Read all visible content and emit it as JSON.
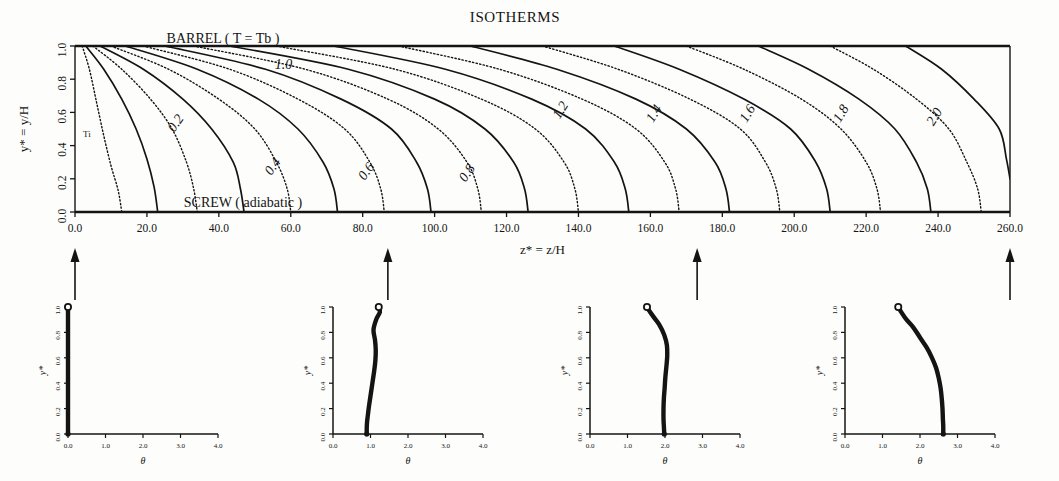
{
  "figure": {
    "title": "ISOTHERMS",
    "barrel_label": "BARREL ( T = Tb )",
    "screw_label": "SCREW ( adiabatic )",
    "inlet_label": "Ti"
  },
  "main": {
    "xlabel": "z* = z/H",
    "ylabel": "y* = y/H",
    "xticks": [
      "0.0",
      "20.0",
      "40.0",
      "60.0",
      "80.0",
      "100.0",
      "120.0",
      "140.0",
      "160.0",
      "180.0",
      "200.0",
      "220.0",
      "240.0",
      "260.0"
    ],
    "yticks": [
      "0.0",
      "0.2",
      "0.4",
      "0.6",
      "0.8",
      "1.0"
    ],
    "contour_labels": [
      "0.2",
      "0.4",
      "0.6",
      "0.8",
      "1.0",
      "1.2",
      "1.4",
      "1.6",
      "1.8",
      "2.0"
    ]
  },
  "subplots": [
    {
      "name": "profile-z0",
      "xlabel": "θ",
      "ylabel": "y*",
      "xticks": [
        "0.0",
        "1.0",
        "2.0",
        "3.0",
        "4.0"
      ],
      "yticks": [
        "0.0",
        "0.2",
        "0.4",
        "0.6",
        "0.8",
        "1.0"
      ]
    },
    {
      "name": "profile-z87",
      "xlabel": "θ",
      "ylabel": "y*",
      "xticks": [
        "0.0",
        "1.0",
        "2.0",
        "3.0",
        "4.0"
      ],
      "yticks": [
        "0.0",
        "0.2",
        "0.4",
        "0.6",
        "0.8",
        "1.0"
      ]
    },
    {
      "name": "profile-z173",
      "xlabel": "θ",
      "ylabel": "y*",
      "xticks": [
        "0.0",
        "1.0",
        "2.0",
        "3.0",
        "4.0"
      ],
      "yticks": [
        "0.0",
        "0.2",
        "0.4",
        "0.6",
        "0.8",
        "1.0"
      ]
    },
    {
      "name": "profile-z260",
      "xlabel": "θ",
      "ylabel": "y*",
      "xticks": [
        "0.0",
        "1.0",
        "2.0",
        "3.0",
        "4.0"
      ],
      "yticks": [
        "0.0",
        "0.2",
        "0.4",
        "0.6",
        "0.8",
        "1.0"
      ]
    }
  ],
  "chart_data": [
    {
      "type": "contour",
      "title": "ISOTHERMS",
      "xlabel": "z* = z/H",
      "ylabel": "y* = y/H",
      "xlim": [
        0,
        260
      ],
      "ylim": [
        0,
        1
      ],
      "grid": false,
      "annotations": [
        "BARREL ( T = Tb )",
        "SCREW ( adiabatic )",
        "Ti"
      ],
      "levels": [
        0.2,
        0.4,
        0.6,
        0.8,
        1.0,
        1.2,
        1.4,
        1.6,
        1.8,
        2.0
      ],
      "level_styles": [
        "solid",
        "solid",
        "solid",
        "solid",
        "solid",
        "solid",
        "solid",
        "solid",
        "solid",
        "solid"
      ],
      "intermediate_levels": [
        0.1,
        0.3,
        0.5,
        0.7,
        0.9,
        1.1,
        1.3,
        1.5,
        1.7,
        1.9,
        2.1
      ],
      "intermediate_style": "dotted",
      "contours": [
        {
          "level": 0.1,
          "style": "dotted",
          "label": "",
          "points": [
            [
              2,
              1.0
            ],
            [
              4,
              0.86
            ],
            [
              6,
              0.66
            ],
            [
              8,
              0.46
            ],
            [
              10,
              0.28
            ],
            [
              12,
              0.13
            ],
            [
              13,
              0.0
            ]
          ]
        },
        {
          "level": 0.2,
          "style": "solid",
          "label": "0.2",
          "label_xy": [
            29,
            0.52
          ],
          "points": [
            [
              3,
              1.0
            ],
            [
              8,
              0.86
            ],
            [
              13,
              0.68
            ],
            [
              17,
              0.5
            ],
            [
              20,
              0.32
            ],
            [
              22,
              0.15
            ],
            [
              23,
              0.0
            ]
          ]
        },
        {
          "level": 0.3,
          "style": "dotted",
          "label": "",
          "points": [
            [
              5,
              1.0
            ],
            [
              13,
              0.86
            ],
            [
              21,
              0.68
            ],
            [
              27,
              0.5
            ],
            [
              31,
              0.3
            ],
            [
              33,
              0.14
            ],
            [
              34,
              0.0
            ]
          ]
        },
        {
          "level": 0.4,
          "style": "solid",
          "label": "0.4",
          "label_xy": [
            56,
            0.26
          ],
          "points": [
            [
              7,
              1.0
            ],
            [
              19,
              0.86
            ],
            [
              30,
              0.68
            ],
            [
              38,
              0.5
            ],
            [
              44,
              0.3
            ],
            [
              46,
              0.14
            ],
            [
              47,
              0.0
            ]
          ]
        },
        {
          "level": 0.5,
          "style": "dotted",
          "label": "",
          "points": [
            [
              10,
              1.0
            ],
            [
              26,
              0.86
            ],
            [
              40,
              0.68
            ],
            [
              50,
              0.5
            ],
            [
              56,
              0.3
            ],
            [
              59,
              0.14
            ],
            [
              60,
              0.0
            ]
          ]
        },
        {
          "level": 0.6,
          "style": "solid",
          "label": "0.6",
          "label_xy": [
            82,
            0.23
          ],
          "points": [
            [
              14,
              1.0
            ],
            [
              34,
              0.86
            ],
            [
              51,
              0.68
            ],
            [
              62,
              0.5
            ],
            [
              69,
              0.3
            ],
            [
              72,
              0.14
            ],
            [
              73,
              0.0
            ]
          ]
        },
        {
          "level": 0.7,
          "style": "dotted",
          "label": "",
          "points": [
            [
              19,
              1.0
            ],
            [
              43,
              0.86
            ],
            [
              62,
              0.68
            ],
            [
              75,
              0.5
            ],
            [
              82,
              0.3
            ],
            [
              85,
              0.14
            ],
            [
              86,
              0.0
            ]
          ]
        },
        {
          "level": 0.8,
          "style": "solid",
          "label": "0.8",
          "label_xy": [
            110,
            0.22
          ],
          "points": [
            [
              25,
              1.0
            ],
            [
              53,
              0.86
            ],
            [
              74,
              0.68
            ],
            [
              88,
              0.5
            ],
            [
              95,
              0.3
            ],
            [
              98,
              0.14
            ],
            [
              99,
              0.0
            ]
          ]
        },
        {
          "level": 0.9,
          "style": "dotted",
          "label": "",
          "points": [
            [
              33,
              1.0
            ],
            [
              64,
              0.86
            ],
            [
              87,
              0.68
            ],
            [
              101,
              0.5
            ],
            [
              109,
              0.3
            ],
            [
              112,
              0.14
            ],
            [
              113,
              0.0
            ]
          ]
        },
        {
          "level": 1.0,
          "style": "solid",
          "label": "1.0",
          "label_xy": [
            58,
            0.86
          ],
          "points": [
            [
              43,
              1.0
            ],
            [
              76,
              0.86
            ],
            [
              100,
              0.68
            ],
            [
              114,
              0.5
            ],
            [
              122,
              0.3
            ],
            [
              125,
              0.14
            ],
            [
              126,
              0.0
            ]
          ]
        },
        {
          "level": 1.1,
          "style": "dotted",
          "label": "",
          "points": [
            [
              56,
              1.0
            ],
            [
              89,
              0.86
            ],
            [
              113,
              0.68
            ],
            [
              128,
              0.5
            ],
            [
              136,
              0.3
            ],
            [
              139,
              0.14
            ],
            [
              140,
              0.0
            ]
          ]
        },
        {
          "level": 1.2,
          "style": "solid",
          "label": "1.2",
          "label_xy": [
            136,
            0.6
          ],
          "points": [
            [
              72,
              1.0
            ],
            [
              103,
              0.86
            ],
            [
              127,
              0.68
            ],
            [
              142,
              0.5
            ],
            [
              150,
              0.3
            ],
            [
              153,
              0.14
            ],
            [
              154,
              0.0
            ]
          ]
        },
        {
          "level": 1.3,
          "style": "dotted",
          "label": "",
          "points": [
            [
              90,
              1.0
            ],
            [
              118,
              0.86
            ],
            [
              141,
              0.68
            ],
            [
              156,
              0.5
            ],
            [
              164,
              0.3
            ],
            [
              167,
              0.14
            ],
            [
              168,
              0.0
            ]
          ]
        },
        {
          "level": 1.4,
          "style": "solid",
          "label": "1.4",
          "label_xy": [
            162,
            0.58
          ],
          "points": [
            [
              110,
              1.0
            ],
            [
              134,
              0.86
            ],
            [
              156,
              0.68
            ],
            [
              170,
              0.5
            ],
            [
              178,
              0.3
            ],
            [
              181,
              0.14
            ],
            [
              182,
              0.0
            ]
          ]
        },
        {
          "level": 1.5,
          "style": "dotted",
          "label": "",
          "points": [
            [
              130,
              1.0
            ],
            [
              151,
              0.86
            ],
            [
              171,
              0.68
            ],
            [
              185,
              0.5
            ],
            [
              192,
              0.3
            ],
            [
              195,
              0.14
            ],
            [
              196,
              0.0
            ]
          ]
        },
        {
          "level": 1.6,
          "style": "solid",
          "label": "1.6",
          "label_xy": [
            188,
            0.58
          ],
          "points": [
            [
              150,
              1.0
            ],
            [
              168,
              0.86
            ],
            [
              186,
              0.68
            ],
            [
              199,
              0.5
            ],
            [
              206,
              0.3
            ],
            [
              209,
              0.14
            ],
            [
              210,
              0.0
            ]
          ]
        },
        {
          "level": 1.7,
          "style": "dotted",
          "label": "",
          "points": [
            [
              170,
              1.0
            ],
            [
              186,
              0.86
            ],
            [
              202,
              0.68
            ],
            [
              213,
              0.5
            ],
            [
              220,
              0.3
            ],
            [
              223,
              0.14
            ],
            [
              224,
              0.0
            ]
          ]
        },
        {
          "level": 1.8,
          "style": "solid",
          "label": "1.8",
          "label_xy": [
            214,
            0.58
          ],
          "points": [
            [
              190,
              1.0
            ],
            [
              204,
              0.86
            ],
            [
              218,
              0.68
            ],
            [
              228,
              0.5
            ],
            [
              234,
              0.3
            ],
            [
              237,
              0.14
            ],
            [
              238,
              0.0
            ]
          ]
        },
        {
          "level": 1.9,
          "style": "dotted",
          "label": "",
          "points": [
            [
              210,
              1.0
            ],
            [
              222,
              0.86
            ],
            [
              234,
              0.68
            ],
            [
              243,
              0.5
            ],
            [
              248,
              0.3
            ],
            [
              251,
              0.14
            ],
            [
              252,
              0.0
            ]
          ]
        },
        {
          "level": 2.0,
          "style": "solid",
          "label": "2.0",
          "label_xy": [
            240,
            0.56
          ],
          "points": [
            [
              231,
              1.0
            ],
            [
              241,
              0.86
            ],
            [
              250,
              0.68
            ],
            [
              257,
              0.5
            ],
            [
              259,
              0.32
            ],
            [
              260,
              0.2
            ]
          ]
        }
      ],
      "marker_positions": [
        0,
        87,
        173,
        260
      ]
    },
    {
      "type": "line",
      "title": "",
      "xlabel": "θ",
      "ylabel": "y*",
      "xlim": [
        0,
        4
      ],
      "ylim": [
        0,
        1
      ],
      "grid": false,
      "series": [
        {
          "name": "theta at z*=0",
          "x": [
            0,
            0,
            0,
            0,
            0,
            0
          ],
          "y": [
            0,
            0.2,
            0.4,
            0.6,
            0.8,
            1.0
          ]
        }
      ]
    },
    {
      "type": "line",
      "title": "",
      "xlabel": "θ",
      "ylabel": "y*",
      "xlim": [
        0,
        4
      ],
      "ylim": [
        0,
        1
      ],
      "grid": false,
      "series": [
        {
          "name": "theta at z*=87",
          "x": [
            0.9,
            0.9,
            0.91,
            0.93,
            0.96,
            1.0,
            1.05,
            1.1,
            1.13,
            1.14,
            1.12,
            1.08,
            1.15,
            1.25,
            1.22
          ],
          "y": [
            0.0,
            0.05,
            0.1,
            0.15,
            0.22,
            0.3,
            0.4,
            0.5,
            0.58,
            0.66,
            0.74,
            0.82,
            0.9,
            0.96,
            1.0
          ]
        }
      ]
    },
    {
      "type": "line",
      "title": "",
      "xlabel": "θ",
      "ylabel": "y*",
      "xlim": [
        0,
        4
      ],
      "ylim": [
        0,
        1
      ],
      "grid": false,
      "series": [
        {
          "name": "theta at z*=173",
          "x": [
            1.98,
            1.97,
            1.96,
            1.96,
            1.97,
            1.99,
            2.01,
            2.04,
            2.06,
            2.05,
            1.98,
            1.85,
            1.7,
            1.58,
            1.52
          ],
          "y": [
            0.0,
            0.06,
            0.12,
            0.2,
            0.28,
            0.36,
            0.45,
            0.54,
            0.62,
            0.7,
            0.78,
            0.86,
            0.92,
            0.97,
            1.0
          ]
        }
      ]
    },
    {
      "type": "line",
      "title": "",
      "xlabel": "θ",
      "ylabel": "y*",
      "xlim": [
        0,
        4
      ],
      "ylim": [
        0,
        1
      ],
      "grid": false,
      "series": [
        {
          "name": "theta at z*=260",
          "x": [
            2.62,
            2.62,
            2.61,
            2.6,
            2.58,
            2.55,
            2.5,
            2.43,
            2.32,
            2.18,
            2.0,
            1.82,
            1.64,
            1.5,
            1.42
          ],
          "y": [
            0.0,
            0.06,
            0.12,
            0.2,
            0.28,
            0.36,
            0.44,
            0.52,
            0.6,
            0.68,
            0.76,
            0.84,
            0.9,
            0.96,
            1.0
          ]
        }
      ]
    }
  ]
}
